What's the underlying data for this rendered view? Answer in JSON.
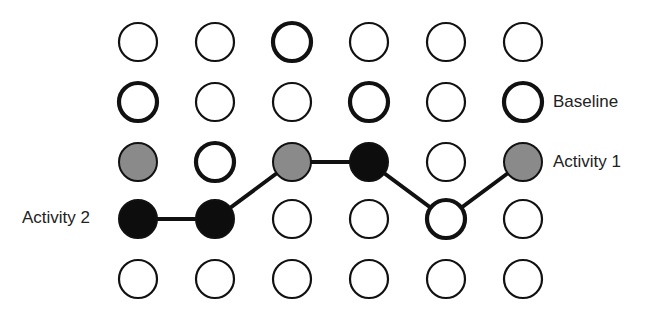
{
  "grid": {
    "columns": [
      138,
      215,
      292,
      369,
      446,
      523
    ],
    "rows": [
      42,
      102,
      162,
      219,
      279
    ],
    "radius": 19
  },
  "colors": {
    "stroke": "#111111",
    "gray_fill": "#8a8a8a",
    "black_fill": "#0d0d0d",
    "white_fill": "#ffffff"
  },
  "nodes": [
    {
      "row": 0,
      "col": 0,
      "style": "thin"
    },
    {
      "row": 0,
      "col": 1,
      "style": "thin"
    },
    {
      "row": 0,
      "col": 2,
      "style": "thick"
    },
    {
      "row": 0,
      "col": 3,
      "style": "thin"
    },
    {
      "row": 0,
      "col": 4,
      "style": "thin"
    },
    {
      "row": 0,
      "col": 5,
      "style": "thin"
    },
    {
      "row": 1,
      "col": 0,
      "style": "thick"
    },
    {
      "row": 1,
      "col": 1,
      "style": "thin"
    },
    {
      "row": 1,
      "col": 2,
      "style": "thin"
    },
    {
      "row": 1,
      "col": 3,
      "style": "thick"
    },
    {
      "row": 1,
      "col": 4,
      "style": "thin"
    },
    {
      "row": 1,
      "col": 5,
      "style": "thick"
    },
    {
      "row": 2,
      "col": 0,
      "style": "gray"
    },
    {
      "row": 2,
      "col": 1,
      "style": "thick"
    },
    {
      "row": 2,
      "col": 2,
      "style": "gray"
    },
    {
      "row": 2,
      "col": 3,
      "style": "black"
    },
    {
      "row": 2,
      "col": 4,
      "style": "thin"
    },
    {
      "row": 2,
      "col": 5,
      "style": "gray"
    },
    {
      "row": 3,
      "col": 0,
      "style": "black"
    },
    {
      "row": 3,
      "col": 1,
      "style": "black"
    },
    {
      "row": 3,
      "col": 2,
      "style": "thin"
    },
    {
      "row": 3,
      "col": 3,
      "style": "thin"
    },
    {
      "row": 3,
      "col": 4,
      "style": "thick"
    },
    {
      "row": 3,
      "col": 5,
      "style": "thin"
    },
    {
      "row": 4,
      "col": 0,
      "style": "thin"
    },
    {
      "row": 4,
      "col": 1,
      "style": "thin"
    },
    {
      "row": 4,
      "col": 2,
      "style": "thin"
    },
    {
      "row": 4,
      "col": 3,
      "style": "thin"
    },
    {
      "row": 4,
      "col": 4,
      "style": "thin"
    },
    {
      "row": 4,
      "col": 5,
      "style": "thin"
    }
  ],
  "path": [
    [
      3,
      0
    ],
    [
      3,
      1
    ],
    [
      2,
      2
    ],
    [
      2,
      3
    ],
    [
      3,
      4
    ],
    [
      2,
      5
    ]
  ],
  "labels": {
    "baseline": "Baseline",
    "activity1": "Activity 1",
    "activity2": "Activity 2"
  }
}
